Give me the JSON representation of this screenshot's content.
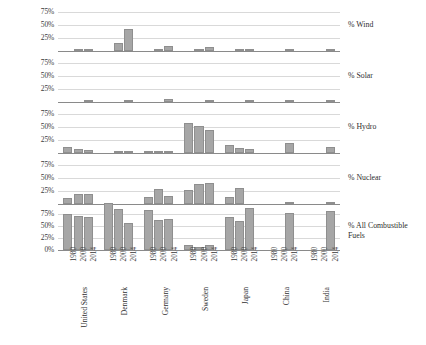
{
  "chart_data": {
    "type": "bar",
    "title": "",
    "xlabel": "",
    "ylabel": "",
    "grid": true,
    "legend": "none",
    "orientation": "vertical",
    "layout": "5 stacked small-multiple panels sharing one categorical x axis",
    "categories": [
      "United States",
      "Denmark",
      "Germany",
      "Sweden",
      "Japan",
      "China",
      "India"
    ],
    "subcategories": [
      "1980",
      "2000",
      "2014"
    ],
    "ytick_labels": [
      "75%",
      "50%",
      "25%"
    ],
    "ytick_labels_bottom": [
      "75%",
      "50%",
      "25%",
      "0%"
    ],
    "ylim": [
      0,
      87.5
    ],
    "ytick_values": [
      75,
      50,
      25
    ],
    "panels": [
      {
        "label": "% Wind",
        "series": [
          {
            "name": "United States",
            "values": [
              0,
              0.2,
              4.4
            ]
          },
          {
            "name": "Denmark",
            "values": [
              0,
              15.0,
              42.0
            ]
          },
          {
            "name": "Germany",
            "values": [
              0,
              1.6,
              9.4
            ]
          },
          {
            "name": "Sweden",
            "values": [
              0,
              0.3,
              7.4
            ]
          },
          {
            "name": "Japan",
            "values": [
              0,
              0.1,
              0.5
            ]
          },
          {
            "name": "China",
            "values": [
              0,
              0,
              2.8
            ]
          },
          {
            "name": "India",
            "values": [
              0,
              0,
              3.0
            ]
          }
        ]
      },
      {
        "label": "% Solar",
        "series": [
          {
            "name": "United States",
            "values": [
              0,
              0,
              0.4
            ]
          },
          {
            "name": "Denmark",
            "values": [
              0,
              0,
              2.2
            ]
          },
          {
            "name": "Germany",
            "values": [
              0,
              0,
              5.5
            ]
          },
          {
            "name": "Sweden",
            "values": [
              0,
              0,
              0.1
            ]
          },
          {
            "name": "Japan",
            "values": [
              0,
              0,
              2.3
            ]
          },
          {
            "name": "China",
            "values": [
              0,
              0,
              0.5
            ]
          },
          {
            "name": "India",
            "values": [
              0,
              0,
              0.7
            ]
          }
        ]
      },
      {
        "label": "% Hydro",
        "series": [
          {
            "name": "United States",
            "values": [
              12.1,
              8.0,
              6.3
            ]
          },
          {
            "name": "Denmark",
            "values": [
              0,
              0.1,
              0.1
            ]
          },
          {
            "name": "Germany",
            "values": [
              4.1,
              4.0,
              3.3
            ]
          },
          {
            "name": "Sweden",
            "values": [
              58.0,
              53.0,
              44.0
            ]
          },
          {
            "name": "Japan",
            "values": [
              16.5,
              9.2,
              8.3
            ]
          },
          {
            "name": "China",
            "values": [
              0,
              0,
              19.0
            ]
          },
          {
            "name": "India",
            "values": [
              0,
              0,
              11.0
            ]
          }
        ]
      },
      {
        "label": "% Nuclear",
        "series": [
          {
            "name": "United States",
            "values": [
              11.0,
              19.8,
              19.5
            ]
          },
          {
            "name": "Denmark",
            "values": [
              0,
              0,
              0
            ]
          },
          {
            "name": "Germany",
            "values": [
              13.0,
              29.5,
              15.8
            ]
          },
          {
            "name": "Sweden",
            "values": [
              26.5,
              39.0,
              41.5
            ]
          },
          {
            "name": "Japan",
            "values": [
              14.5,
              30.5,
              0
            ]
          },
          {
            "name": "China",
            "values": [
              0,
              0,
              2.3
            ]
          },
          {
            "name": "India",
            "values": [
              0,
              0,
              2.9
            ]
          }
        ]
      },
      {
        "label": "% All Combustible\nFuels",
        "series": [
          {
            "name": "United States",
            "values": [
              76.0,
              71.5,
              68.0
            ]
          },
          {
            "name": "Denmark",
            "values": [
              99.0,
              85.0,
              57.0
            ]
          },
          {
            "name": "Germany",
            "values": [
              82.5,
              63.5,
              65.0
            ]
          },
          {
            "name": "Sweden",
            "values": [
              11.5,
              6.5,
              9.5
            ]
          },
          {
            "name": "Japan",
            "values": [
              69.0,
              61.0,
              88.0
            ]
          },
          {
            "name": "China",
            "values": [
              0,
              0,
              78.0
            ]
          },
          {
            "name": "India",
            "values": [
              0,
              0,
              82.0
            ]
          }
        ]
      }
    ],
    "colors": {
      "bar_fill": "#a6a6a6",
      "bar_stroke": "#8f8f8f",
      "gridline": "#d9d9d9",
      "axis": "#8a8a8a",
      "text": "#3a3a3a"
    }
  }
}
